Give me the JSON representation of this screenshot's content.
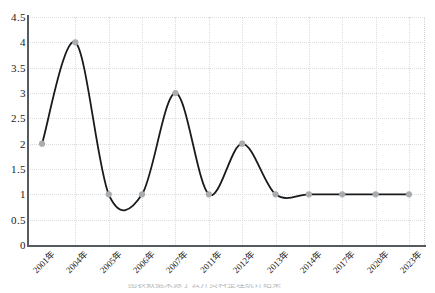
{
  "chart_data": {
    "type": "line",
    "title": "",
    "xlabel": "",
    "ylabel": "",
    "categories": [
      "2001年",
      "2004年",
      "2005年",
      "2006年",
      "2007年",
      "2011年",
      "2012年",
      "2013年",
      "2014年",
      "2017年",
      "2020年",
      "2023年"
    ],
    "values": [
      2,
      4,
      1,
      1,
      3,
      1,
      2,
      1,
      1,
      1,
      1,
      1
    ],
    "series": [
      {
        "name": "",
        "values": [
          2,
          4,
          1,
          1,
          3,
          1,
          2,
          1,
          1,
          1,
          1,
          1
        ]
      }
    ],
    "ylim": [
      0,
      4.5
    ],
    "y_ticks": [
      "0",
      "0.5",
      "1",
      "1.5",
      "2",
      "2.5",
      "3",
      "3.5",
      "4",
      "4.5"
    ],
    "y_tick_values": [
      0,
      0.5,
      1,
      1.5,
      2,
      2.5,
      3,
      3.5,
      4,
      4.5
    ],
    "grid": true,
    "grid_style": "dotted",
    "legend": "none",
    "smoothing": "spline",
    "marker": "circle"
  },
  "style": {
    "line_color": "#1a1a1a",
    "marker_color": "#a9adb0",
    "grid_color": "#d9dde0",
    "axis_color": "#555b5e",
    "background": "#ffffff",
    "text_color": "#1a1a1a"
  },
  "caption": {
    "text": "图表数据来源于公开资料整理统计结果",
    "visible": "partial"
  }
}
